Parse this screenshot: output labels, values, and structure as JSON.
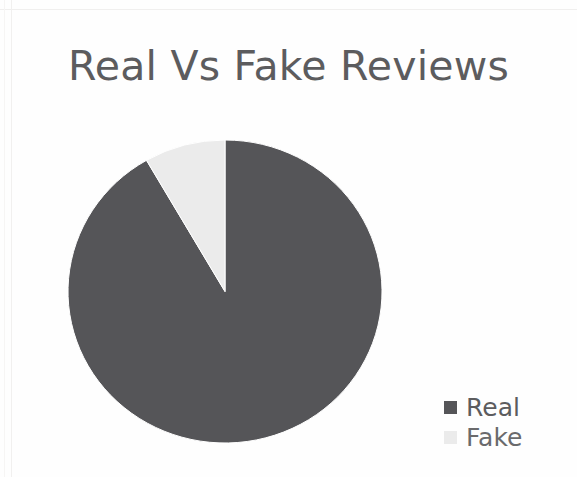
{
  "chart_data": {
    "type": "pie",
    "title": "Real Vs Fake Reviews",
    "categories": [
      "Real",
      "Fake"
    ],
    "values": [
      92,
      8
    ],
    "value_unit": "percent",
    "slice_angles_deg": [
      330,
      30
    ],
    "start_angle_deg": 0,
    "direction": "counterclockwise",
    "colors": [
      "#555558",
      "#ebebeb"
    ],
    "legend": {
      "position": "right",
      "entries": [
        {
          "label": "Real",
          "color": "#555558"
        },
        {
          "label": "Fake",
          "color": "#ebebeb"
        }
      ]
    },
    "grid": false,
    "xlabel": "",
    "ylabel": ""
  },
  "title": {
    "text": "Real Vs Fake Reviews",
    "color": "#5c5c5e"
  },
  "pie": {
    "real_label": "Real",
    "fake_label": "Fake",
    "real_color": "#555558",
    "fake_color": "#ebebeb",
    "edge_color": "#ffffff"
  },
  "legend": {
    "entries": [
      {
        "label": "Real",
        "color": "#555558"
      },
      {
        "label": "Fake",
        "color": "#ebebeb"
      }
    ]
  }
}
